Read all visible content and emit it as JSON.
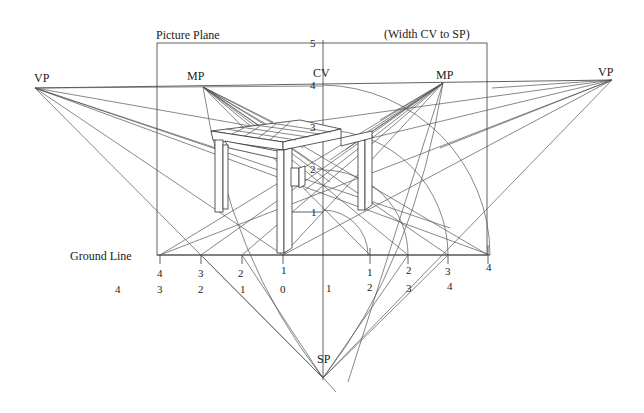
{
  "labels": {
    "picture_plane": "Picture Plane",
    "width_note": "(Width CV to SP)",
    "vp_left": "VP",
    "vp_right": "VP",
    "mp_left": "MP",
    "mp_right": "MP",
    "cv": "CV",
    "sp": "SP",
    "ground_line": "Ground Line"
  },
  "height_scale": [
    "5",
    "4",
    "3",
    "2",
    "1"
  ],
  "ground_ticks_left": [
    "4",
    "3",
    "2",
    "1"
  ],
  "ground_ticks_right": [
    "1",
    "2",
    "3",
    "4"
  ],
  "bottom_scale": [
    "4",
    "3",
    "2",
    "1",
    "0",
    "1",
    "2",
    "3",
    "4"
  ],
  "colors": {
    "line": "#3a3a3a",
    "text": "#1a1a1a",
    "background": "#ffffff"
  }
}
